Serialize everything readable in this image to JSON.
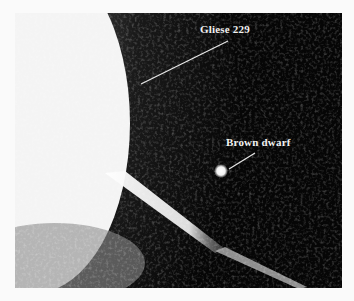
{
  "figure": {
    "labels": [
      {
        "text": "Gliese 229"
      },
      {
        "text": "Brown dwarf"
      }
    ],
    "colors": {
      "background": "#060606",
      "glare": "#f5f5f5",
      "label": "#f2f2f2",
      "page": "#fafafa"
    }
  }
}
